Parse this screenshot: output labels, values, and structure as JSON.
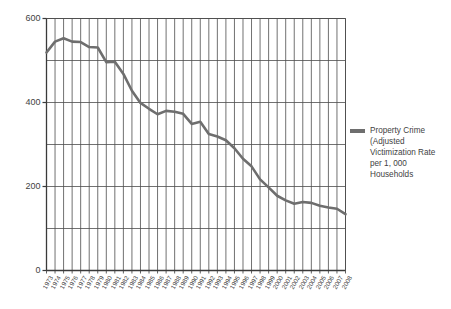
{
  "chart_data": {
    "type": "line",
    "title": "",
    "subtitle": "",
    "xlabel": "",
    "ylabel": "",
    "ylim": [
      0,
      600
    ],
    "ytick_values": [
      0,
      200,
      400,
      600
    ],
    "ytick_labels": [
      "0",
      "200",
      "400",
      "600"
    ],
    "gridline_interval": 100,
    "grid": true,
    "grid_vertical": true,
    "legend_position": "right",
    "categories": [
      "1973",
      "1974",
      "1975",
      "1976",
      "1977",
      "1978",
      "1979",
      "1980",
      "1981",
      "1982",
      "1983",
      "1984",
      "1985",
      "1986",
      "1987",
      "1988",
      "1989",
      "1990",
      "1991",
      "1992",
      "1993",
      "1994",
      "1995",
      "1996",
      "1997",
      "1998",
      "1999",
      "2000",
      "2001",
      "2002",
      "2003",
      "2004",
      "2005",
      "2006",
      "2007",
      "2008"
    ],
    "series": [
      {
        "name": "Property Crime (Adjusted Victimization Rate per 1,000 Households",
        "color": "#6e6e6e",
        "values": [
          519,
          545,
          553,
          545,
          544,
          532,
          531,
          496,
          497,
          468,
          428,
          399,
          385,
          372,
          380,
          378,
          373,
          349,
          354,
          325,
          319,
          310,
          291,
          266,
          248,
          217,
          198,
          178,
          167,
          159,
          163,
          161,
          154,
          150,
          147,
          134
        ]
      }
    ]
  },
  "legend": {
    "entries": [
      {
        "label": "Property Crime (Adjusted Victimization Rate per 1, 000 Households",
        "color": "#6e6e6e",
        "swatch_name": "legend-swatch-property-crime"
      }
    ]
  },
  "colors": {
    "line": "#6e6e6e",
    "grid": "#4d4d4d",
    "axis": "#3a3a3a",
    "text": "#3f3f3f",
    "background": "#ffffff"
  }
}
